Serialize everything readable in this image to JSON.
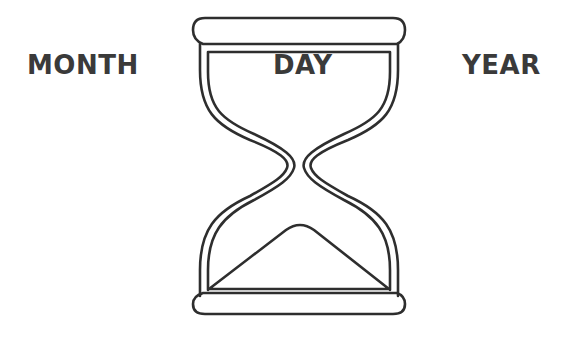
{
  "labels": {
    "left": "MONTH",
    "center": "DAY",
    "right": "YEAR"
  },
  "icon": {
    "name": "hourglass-icon",
    "stroke_color": "#2e2e2e",
    "fill_color": "#ffffff"
  },
  "colors": {
    "background": "#ffffff",
    "text": "#3a3a3a"
  }
}
